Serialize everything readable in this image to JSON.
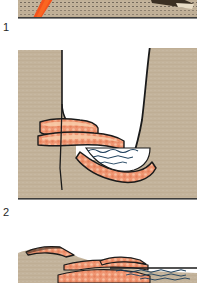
{
  "figure": {
    "panel_count": 3
  },
  "colors": {
    "land": "#c3b39b",
    "land_shadow": "#b4a28a",
    "reef": "#ef9673",
    "reef_dark": "#d9643c",
    "reef_highlight": "#f7c9a8",
    "water": "#ffffff",
    "water_line": "#1c3f5c",
    "outline": "#1a1a1a",
    "baseline": "#3b3b3b",
    "lava": "#f4531c",
    "label_text": "#262626",
    "background": "#ffffff"
  },
  "panels": [
    {
      "id": "panel-1",
      "label": "1",
      "caption": "1",
      "description": "Lower edge of first cross-section: tan volcanic island slope crossed by a bright orange lava streak, with a dark angular ridge at upper right.",
      "features": [
        {
          "name": "island-slope",
          "fill": "land"
        },
        {
          "name": "lava-flow-streak",
          "fill": "lava"
        },
        {
          "name": "ridge-crest",
          "fill": "outline"
        },
        {
          "name": "panel-baseline",
          "fill": "baseline"
        }
      ]
    },
    {
      "id": "panel-2",
      "label": "2",
      "caption": "2",
      "description": "Second cross-section: steep-walled valley cut into tan bedrock, with coral-orange terraced reef deposits on the left bench and across the valley floor, holding a pool of water.",
      "features": [
        {
          "name": "left-cliff",
          "fill": "land"
        },
        {
          "name": "right-cliff",
          "fill": "land"
        },
        {
          "name": "upper-reef-terrace",
          "fill": "reef"
        },
        {
          "name": "lower-reef-terrace",
          "fill": "reef"
        },
        {
          "name": "valley-floor-reef",
          "fill": "reef"
        },
        {
          "name": "lagoon-water",
          "fill": "water"
        },
        {
          "name": "fracture-line",
          "fill": "outline"
        },
        {
          "name": "panel-baseline",
          "fill": "baseline"
        }
      ]
    },
    {
      "id": "panel-3",
      "label": "",
      "caption": "",
      "description": "Third cross-section (top portion): low tan island profile with coral-orange reef crests stepping down to the right, meeting open water ruled with wavy surface lines.",
      "features": [
        {
          "name": "island-profile",
          "fill": "land"
        },
        {
          "name": "summit-reef-cap",
          "fill": "reef"
        },
        {
          "name": "mid-slope-reef",
          "fill": "reef"
        },
        {
          "name": "outer-reef-crest",
          "fill": "reef"
        },
        {
          "name": "sea-surface",
          "fill": "water_line"
        }
      ]
    }
  ]
}
